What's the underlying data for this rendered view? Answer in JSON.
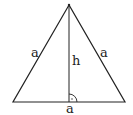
{
  "diagram": {
    "labels": {
      "left_side": "a",
      "right_side": "a",
      "base": "a",
      "height": "h"
    },
    "vertices": {
      "apex": [
        69,
        5
      ],
      "base_left": [
        13,
        102
      ],
      "base_right": [
        125,
        102
      ],
      "foot": [
        69,
        102
      ]
    },
    "colors": {
      "stroke": "#222222",
      "background": "#ffffff"
    }
  }
}
